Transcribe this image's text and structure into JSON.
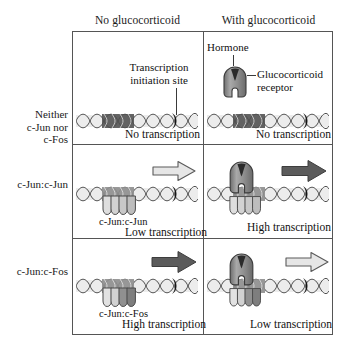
{
  "figure": {
    "columns": [
      {
        "id": "no-glucocorticoid",
        "label": "No glucocorticoid"
      },
      {
        "id": "with-glucocorticoid",
        "label": "With glucocorticoid"
      }
    ],
    "row_labels": [
      {
        "id": "neither",
        "line1": "Neither",
        "line2": "c-Jun nor",
        "line3": "c-Fos"
      },
      {
        "id": "jun-jun",
        "label": "c-Jun:c-Jun"
      },
      {
        "id": "jun-fos",
        "label": "c-Jun:c-Fos"
      }
    ],
    "callouts": {
      "transcription_initiation": {
        "line1": "Transcription",
        "line2": "initiation site"
      },
      "hormone": "Hormone",
      "receptor": {
        "line1": "Glucocorticoid",
        "line2": "receptor"
      }
    },
    "cells": [
      {
        "id": "neither-no",
        "row": "neither",
        "column": "no-glucocorticoid",
        "caption": "No transcription",
        "complex": "none",
        "receptor_bound": false,
        "arrow": "none"
      },
      {
        "id": "neither-with",
        "row": "neither",
        "column": "with-glucocorticoid",
        "caption": "No transcription",
        "complex": "none",
        "receptor_bound": false,
        "arrow": "none"
      },
      {
        "id": "junjun-no",
        "row": "jun-jun",
        "column": "no-glucocorticoid",
        "caption": "Low transcription",
        "sublabel": "c-Jun:c-Jun",
        "complex": "jun-jun",
        "receptor_bound": false,
        "arrow": "light"
      },
      {
        "id": "junjun-with",
        "row": "jun-jun",
        "column": "with-glucocorticoid",
        "caption": "High transcription",
        "complex": "jun-jun",
        "receptor_bound": true,
        "arrow": "dark"
      },
      {
        "id": "junfos-no",
        "row": "jun-fos",
        "column": "no-glucocorticoid",
        "caption": "High transcription",
        "sublabel": "c-Jun:c-Fos",
        "complex": "jun-fos",
        "receptor_bound": false,
        "arrow": "dark"
      },
      {
        "id": "junfos-with",
        "row": "jun-fos",
        "column": "with-glucocorticoid",
        "caption": "Low transcription",
        "complex": "jun-fos",
        "receptor_bound": true,
        "arrow": "light"
      }
    ],
    "legend_semantics": {
      "dark_arrow_meaning": "High transcription",
      "light_arrow_meaning": "Low transcription"
    },
    "colors": {
      "border": "#555555",
      "dna_strand": "#ffffff",
      "dna_shadow": "#e6e6e6",
      "promoter_dark": "#3c3c3c",
      "initiation_site": "#1a1a1a",
      "receptor_body": "#8f8f8f",
      "hormone_notch": "#2b2b2b",
      "jun_lobe": "#dcdcdc",
      "fos_lobe": "#8c8c8c",
      "arrow_dark": "#555555",
      "arrow_light": "#e3e3e3",
      "text": "#111111"
    }
  }
}
